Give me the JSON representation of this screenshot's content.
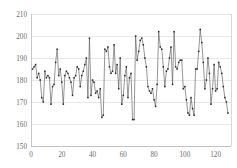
{
  "chart_data": {
    "type": "line",
    "title": "",
    "subtitle": "",
    "xlabel": "",
    "ylabel": "",
    "grid": true,
    "legend": false,
    "legend_position": "none",
    "marker": "square",
    "line_color": "#4f4f4f",
    "marker_color": "#2b2b2b",
    "grid_color": "#d9d9d9",
    "xlim": [
      0,
      130
    ],
    "ylim": [
      150,
      210
    ],
    "yticks": [
      150,
      160,
      170,
      180,
      190,
      200,
      210
    ],
    "ytick_labels": [
      "150",
      "160",
      "170",
      "180",
      "190",
      "200",
      "210"
    ],
    "xticks": [
      0,
      20,
      40,
      60,
      80,
      100,
      120
    ],
    "xtick_labels": [
      "0",
      "20",
      "40",
      "60",
      "80",
      "100",
      "120"
    ],
    "series": [
      {
        "name": "series-1",
        "x": [
          1,
          2,
          3,
          4,
          5,
          6,
          7,
          8,
          9,
          10,
          11,
          12,
          13,
          14,
          15,
          16,
          17,
          18,
          19,
          20,
          21,
          22,
          23,
          24,
          25,
          26,
          27,
          28,
          29,
          30,
          31,
          32,
          33,
          34,
          35,
          36,
          37,
          38,
          39,
          40,
          41,
          42,
          43,
          44,
          45,
          46,
          47,
          48,
          49,
          50,
          51,
          52,
          53,
          54,
          55,
          56,
          57,
          58,
          59,
          60,
          61,
          62,
          63,
          64,
          65,
          66,
          67,
          68,
          69,
          70,
          71,
          72,
          73,
          74,
          75,
          76,
          77,
          78,
          79,
          80,
          81,
          82,
          83,
          84,
          85,
          86,
          87,
          88,
          89,
          90,
          91,
          92,
          93,
          94,
          95,
          96,
          97,
          98,
          99,
          100,
          101,
          102,
          103,
          104,
          105,
          106,
          107,
          108,
          109,
          110,
          111,
          112,
          113,
          114,
          115,
          116,
          117,
          118,
          119,
          120,
          121,
          122,
          123,
          124,
          125,
          126,
          127,
          128
        ],
        "values": [
          185,
          186,
          187,
          181,
          183,
          180,
          172,
          170,
          184,
          181,
          182,
          181,
          169,
          177,
          178,
          188,
          194,
          182,
          185,
          179,
          169,
          182,
          184,
          183,
          181,
          179,
          173,
          181,
          182,
          186,
          185,
          177,
          182,
          184,
          187,
          190,
          172,
          199,
          173,
          180,
          179,
          174,
          175,
          172,
          176,
          163,
          164,
          194,
          193,
          195,
          186,
          183,
          184,
          196,
          183,
          187,
          176,
          190,
          169,
          173,
          182,
          186,
          172,
          181,
          183,
          162,
          162,
          200,
          189,
          193,
          198,
          199,
          196,
          190,
          186,
          177,
          175,
          174,
          176,
          171,
          168,
          178,
          202,
          195,
          194,
          186,
          177,
          184,
          185,
          190,
          195,
          178,
          202,
          186,
          185,
          188,
          189,
          189,
          176,
          177,
          171,
          165,
          164,
          172,
          167,
          164,
          185,
          185,
          193,
          203,
          197,
          188,
          176,
          180,
          190,
          183,
          169,
          176,
          187,
          175,
          176,
          188,
          186,
          183,
          177,
          172,
          170,
          165
        ]
      }
    ]
  }
}
